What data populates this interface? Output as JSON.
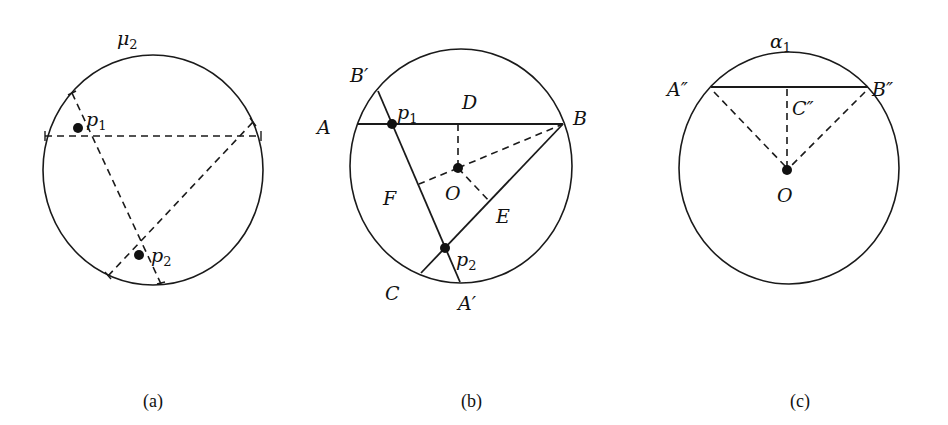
{
  "figures": [
    {
      "id": "a",
      "caption": "(a)",
      "circle_label": {
        "base": "μ",
        "sub": "2"
      },
      "points": [
        {
          "base": "p",
          "sub": "1"
        },
        {
          "base": "p",
          "sub": "2"
        }
      ]
    },
    {
      "id": "b",
      "caption": "(b)",
      "points": [
        {
          "base": "B",
          "prime": "′"
        },
        {
          "base": "p",
          "sub": "1"
        },
        {
          "base": "D"
        },
        {
          "base": "A"
        },
        {
          "base": "B"
        },
        {
          "base": "O"
        },
        {
          "base": "F"
        },
        {
          "base": "E"
        },
        {
          "base": "p",
          "sub": "2"
        },
        {
          "base": "C"
        },
        {
          "base": "A",
          "prime": "′"
        }
      ]
    },
    {
      "id": "c",
      "caption": "(c)",
      "circle_label": {
        "base": "α",
        "sub": "1"
      },
      "points": [
        {
          "base": "A",
          "prime": "″"
        },
        {
          "base": "B",
          "prime": "″"
        },
        {
          "base": "C",
          "prime": "″"
        },
        {
          "base": "O"
        }
      ]
    }
  ],
  "colors": {
    "stroke": "#1a1a1a",
    "background": "#ffffff"
  }
}
